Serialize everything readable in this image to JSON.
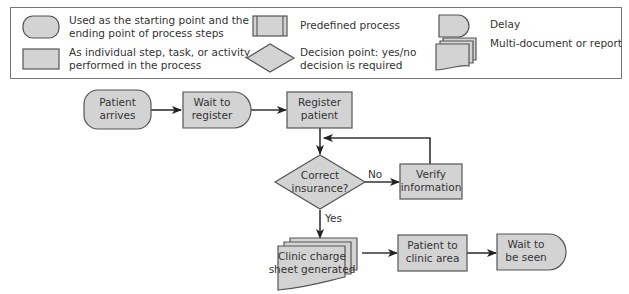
{
  "legend": {
    "items": [
      {
        "shape": "terminator",
        "lines": [
          "Used as the starting point and the",
          "ending point of process steps"
        ]
      },
      {
        "shape": "process",
        "lines": [
          "As individual step, task, or activity",
          "performed in the process"
        ]
      },
      {
        "shape": "predefined-process",
        "lines": [
          "Predefined process"
        ]
      },
      {
        "shape": "decision",
        "lines": [
          "Decision point: yes/no",
          "decision is required"
        ]
      },
      {
        "shape": "delay",
        "lines": [
          "Delay"
        ]
      },
      {
        "shape": "multi-document",
        "lines": [
          "Multi-document or report"
        ]
      }
    ]
  },
  "flow": {
    "nodes": {
      "patient_arrives": [
        "Patient",
        "arrives"
      ],
      "wait_to_register": [
        "Wait to",
        "register"
      ],
      "register_patient": [
        "Register",
        "patient"
      ],
      "correct_insurance": [
        "Correct",
        "insurance?"
      ],
      "verify_information": [
        "Verify",
        "information"
      ],
      "charge_sheet": [
        "Clinic charge",
        "sheet generated"
      ],
      "patient_to_clinic": [
        "Patient to",
        "clinic area"
      ],
      "wait_to_be_seen": [
        "Wait to",
        "be seen"
      ]
    },
    "edge_labels": {
      "no": "No",
      "yes": "Yes"
    }
  },
  "colors": {
    "shape_fill": "#d3d3d3",
    "shape_stroke": "#555555",
    "line": "#333333"
  }
}
